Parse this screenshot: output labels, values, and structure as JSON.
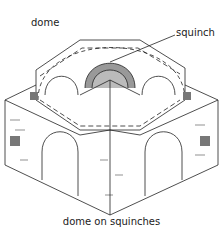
{
  "diagram": {
    "title": "dome on squinches",
    "labels": [
      {
        "id": "dome",
        "text": "dome"
      },
      {
        "id": "squinch",
        "text": "squinch"
      }
    ],
    "colors": {
      "line": "#222222",
      "shade": "#888888",
      "background": "#ffffff"
    }
  }
}
